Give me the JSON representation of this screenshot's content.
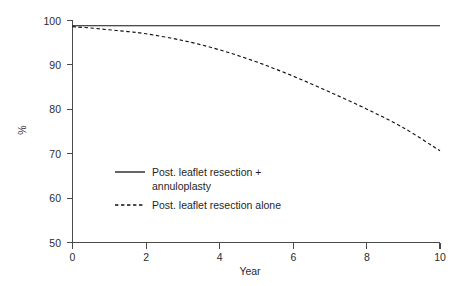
{
  "chart_data": {
    "type": "line",
    "title": "",
    "subtitle": "",
    "xlabel": "Year",
    "ylabel": "%",
    "xlim": [
      0,
      10
    ],
    "ylim": [
      50,
      100
    ],
    "xticks": [
      "0",
      "2",
      "4",
      "6",
      "8",
      "10"
    ],
    "yticks": [
      "50",
      "60",
      "70",
      "80",
      "90",
      "100"
    ],
    "xtick_values": [
      0,
      2,
      4,
      6,
      8,
      10
    ],
    "ytick_values": [
      50,
      60,
      70,
      80,
      90,
      100
    ],
    "grid": false,
    "legend_position": "inside-lower-left",
    "series": [
      {
        "name": "Post. leaflet resection + annuloplasty",
        "style": "solid",
        "color": "#111111",
        "x": [
          0,
          0.5,
          1,
          2,
          3,
          4,
          5,
          6,
          7,
          8,
          9,
          10
        ],
        "values": [
          98.7,
          98.7,
          98.7,
          98.7,
          98.7,
          98.7,
          98.7,
          98.7,
          98.7,
          98.7,
          98.7,
          98.7
        ]
      },
      {
        "name": "Post. leaflet resection alone",
        "style": "dashed",
        "color": "#111111",
        "x": [
          0,
          0.5,
          1,
          1.5,
          2,
          3,
          4,
          5,
          6,
          7,
          8,
          9,
          10
        ],
        "values": [
          98.5,
          98.2,
          97.8,
          97.4,
          96.9,
          95.4,
          93.3,
          90.6,
          87.4,
          83.8,
          80.0,
          75.8,
          70.6
        ]
      }
    ]
  },
  "axes": {
    "ylabel": "%",
    "xlabel": "Year",
    "ytick_labels": [
      "100",
      "90",
      "80",
      "70",
      "60",
      "50"
    ],
    "xtick_labels": [
      "0",
      "2",
      "4",
      "6",
      "8",
      "10"
    ]
  },
  "legend": {
    "entries": [
      {
        "style": "solid",
        "line1": "Post. leaflet resection +",
        "line2": "annuloplasty"
      },
      {
        "style": "dashed",
        "line1": "Post. leaflet resection alone",
        "line2": ""
      }
    ]
  }
}
